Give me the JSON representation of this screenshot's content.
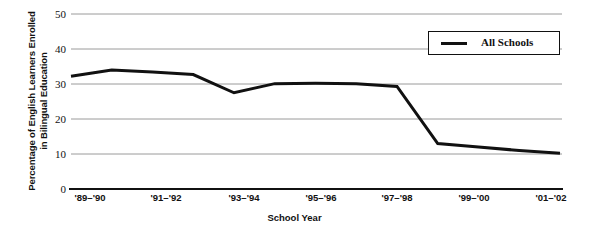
{
  "chart_data": {
    "type": "line",
    "title": "",
    "xlabel": "School Year",
    "ylabel": "Percentage of English Learners Enrolled\nin Bilingual Education",
    "ylim": [
      0,
      50
    ],
    "yticks": [
      0,
      10,
      20,
      30,
      40,
      50
    ],
    "grid": true,
    "legend_position": "upper right",
    "categories": [
      "'89–'90",
      "'90–'91",
      "'91–'92",
      "'92–'93",
      "'93–'94",
      "'94–'95",
      "'95–'96",
      "'96–'97",
      "'97–'98",
      "'98–'99",
      "'99–'00",
      "'00–'01",
      "'01–'02"
    ],
    "xtick_labels": [
      "'89–'90",
      "'91–'92",
      "'93–'94",
      "'95–'96",
      "'97–'98",
      "'99–'00",
      "'01–'02"
    ],
    "series": [
      {
        "name": "All Schools",
        "color": "#111111",
        "values": [
          32.2,
          34.0,
          33.4,
          32.7,
          27.5,
          30.1,
          30.2,
          30.1,
          29.3,
          13.0,
          12.0,
          11.0,
          10.2
        ]
      }
    ]
  },
  "legend": {
    "entries": [
      {
        "label": "All Schools",
        "color": "#111111"
      }
    ]
  },
  "axes": {
    "y_title": "Percentage of English Learners Enrolled\nin Bilingual Education",
    "x_title": "School Year",
    "y_tick_labels": [
      "50",
      "40",
      "30",
      "20",
      "10",
      "0"
    ],
    "x_tick_labels": [
      "'89–'90",
      "'91–'92",
      "'93–'94",
      "'95–'96",
      "'97–'98",
      "'99–'00",
      "'01–'02"
    ]
  },
  "colors": {
    "line": "#111111",
    "grid": "#9a9a9a",
    "axis": "#111111",
    "background": "#ffffff"
  }
}
